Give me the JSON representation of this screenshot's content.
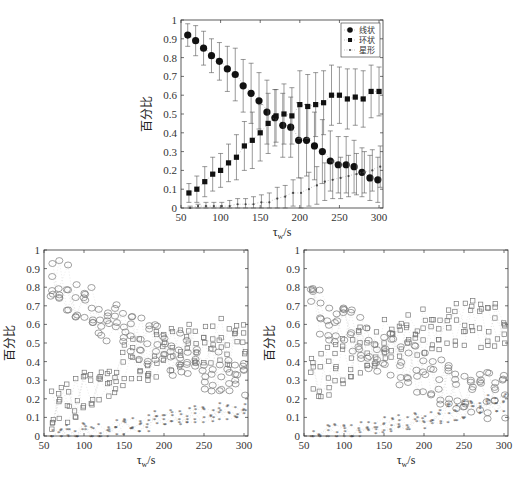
{
  "chart_data": [
    {
      "type": "scatter",
      "title": "",
      "xlabel": "τ_w/s",
      "ylabel": "百分比",
      "xlim": [
        50,
        305
      ],
      "ylim": [
        0,
        1
      ],
      "xticks": [
        50,
        100,
        150,
        200,
        250,
        300
      ],
      "yticks": [
        0,
        0.1,
        0.2,
        0.3,
        0.4,
        0.5,
        0.6,
        0.7,
        0.8,
        0.9,
        1
      ],
      "legend": {
        "position": "upper right",
        "entries": [
          "线状",
          "环状",
          "星形"
        ]
      },
      "error_bars": true,
      "x": [
        60,
        70,
        80,
        90,
        100,
        110,
        120,
        130,
        140,
        150,
        160,
        170,
        180,
        190,
        200,
        210,
        220,
        230,
        240,
        250,
        260,
        270,
        280,
        290,
        300
      ],
      "series": [
        {
          "name": "线状",
          "marker": "circle",
          "values": [
            0.92,
            0.89,
            0.85,
            0.81,
            0.78,
            0.74,
            0.71,
            0.65,
            0.61,
            0.57,
            0.51,
            0.48,
            0.44,
            0.43,
            0.36,
            0.36,
            0.33,
            0.3,
            0.25,
            0.23,
            0.23,
            0.22,
            0.19,
            0.16,
            0.15
          ],
          "err": [
            0.06,
            0.08,
            0.09,
            0.09,
            0.1,
            0.12,
            0.14,
            0.14,
            0.16,
            0.15,
            0.17,
            0.15,
            0.17,
            0.16,
            0.2,
            0.19,
            0.18,
            0.17,
            0.16,
            0.15,
            0.15,
            0.14,
            0.13,
            0.12,
            0.12
          ]
        },
        {
          "name": "环状",
          "marker": "square",
          "values": [
            0.08,
            0.1,
            0.14,
            0.18,
            0.2,
            0.24,
            0.27,
            0.33,
            0.36,
            0.4,
            0.45,
            0.49,
            0.5,
            0.49,
            0.55,
            0.54,
            0.55,
            0.56,
            0.6,
            0.6,
            0.58,
            0.59,
            0.58,
            0.62,
            0.62
          ],
          "err": [
            0.05,
            0.07,
            0.08,
            0.09,
            0.09,
            0.1,
            0.12,
            0.13,
            0.15,
            0.15,
            0.16,
            0.14,
            0.16,
            0.15,
            0.18,
            0.17,
            0.17,
            0.17,
            0.16,
            0.15,
            0.16,
            0.15,
            0.15,
            0.14,
            0.13
          ]
        },
        {
          "name": "星形",
          "marker": "dot",
          "values": [
            0.0,
            0.01,
            0.01,
            0.01,
            0.01,
            0.01,
            0.02,
            0.02,
            0.02,
            0.03,
            0.03,
            0.05,
            0.06,
            0.08,
            0.08,
            0.1,
            0.12,
            0.14,
            0.15,
            0.16,
            0.17,
            0.18,
            0.19,
            0.2,
            0.22
          ],
          "err": [
            0.01,
            0.01,
            0.02,
            0.02,
            0.02,
            0.03,
            0.03,
            0.03,
            0.04,
            0.04,
            0.05,
            0.06,
            0.06,
            0.07,
            0.08,
            0.09,
            0.1,
            0.1,
            0.1,
            0.11,
            0.11,
            0.11,
            0.11,
            0.11,
            0.11
          ]
        }
      ]
    },
    {
      "type": "scatter",
      "title": "",
      "xlabel": "τ_w/s",
      "ylabel": "百分比",
      "xlim": [
        50,
        305
      ],
      "ylim": [
        0,
        1
      ],
      "xticks": [
        50,
        100,
        150,
        200,
        250,
        300
      ],
      "yticks": [
        0,
        0.1,
        0.2,
        0.3,
        0.4,
        0.5,
        0.6,
        0.7,
        0.8,
        0.9,
        1
      ],
      "note": "Individual runs: circles=线状 (declining from ~0.9 to ~0.3), squares=环状 (rising from ~0.15 to ~0.5), stars=星形 (rising from ~0 to ~0.15)",
      "x": [
        60,
        70,
        80,
        90,
        100,
        110,
        120,
        130,
        140,
        150,
        160,
        170,
        180,
        190,
        200,
        210,
        220,
        230,
        240,
        250,
        260,
        270,
        280,
        290,
        300
      ],
      "series": [
        {
          "name": "线状",
          "marker": "circle-open",
          "values": [
            0.86,
            0.84,
            0.8,
            0.76,
            0.72,
            0.68,
            0.64,
            0.62,
            0.6,
            0.57,
            0.54,
            0.52,
            0.5,
            0.48,
            0.46,
            0.44,
            0.43,
            0.41,
            0.4,
            0.38,
            0.37,
            0.36,
            0.35,
            0.34,
            0.33
          ]
        },
        {
          "name": "环状",
          "marker": "square-open",
          "values": [
            0.14,
            0.16,
            0.19,
            0.23,
            0.26,
            0.29,
            0.32,
            0.34,
            0.36,
            0.38,
            0.4,
            0.41,
            0.43,
            0.44,
            0.45,
            0.46,
            0.47,
            0.48,
            0.49,
            0.5,
            0.5,
            0.51,
            0.51,
            0.52,
            0.52
          ]
        },
        {
          "name": "星形",
          "marker": "star",
          "values": [
            0.0,
            0.0,
            0.01,
            0.01,
            0.02,
            0.02,
            0.03,
            0.03,
            0.04,
            0.05,
            0.06,
            0.06,
            0.07,
            0.08,
            0.09,
            0.09,
            0.1,
            0.1,
            0.11,
            0.12,
            0.12,
            0.13,
            0.13,
            0.14,
            0.14
          ]
        }
      ]
    },
    {
      "type": "scatter",
      "title": "",
      "xlabel": "τ_w/s",
      "ylabel": "百分比",
      "xlim": [
        50,
        305
      ],
      "ylim": [
        0,
        1
      ],
      "xticks": [
        50,
        100,
        150,
        200,
        250,
        300
      ],
      "yticks": [
        0,
        0.1,
        0.2,
        0.3,
        0.4,
        0.5,
        0.6,
        0.7,
        0.8,
        0.9,
        1
      ],
      "note": "Individual runs: circles=线状 (declining from ~0.7 to ~0.2), squares=环状 (rising from ~0.3 to ~0.6), stars=星形 (rising from ~0 to ~0.2)",
      "x": [
        60,
        70,
        80,
        90,
        100,
        110,
        120,
        130,
        140,
        150,
        160,
        170,
        180,
        190,
        200,
        210,
        220,
        230,
        240,
        250,
        260,
        270,
        280,
        290,
        300
      ],
      "series": [
        {
          "name": "线状",
          "marker": "circle-open",
          "values": [
            0.68,
            0.66,
            0.63,
            0.61,
            0.58,
            0.55,
            0.52,
            0.49,
            0.47,
            0.45,
            0.43,
            0.4,
            0.38,
            0.36,
            0.34,
            0.32,
            0.3,
            0.28,
            0.27,
            0.25,
            0.24,
            0.23,
            0.22,
            0.21,
            0.2
          ]
        },
        {
          "name": "环状",
          "marker": "square-open",
          "values": [
            0.3,
            0.32,
            0.35,
            0.38,
            0.41,
            0.44,
            0.46,
            0.48,
            0.49,
            0.5,
            0.52,
            0.53,
            0.54,
            0.55,
            0.56,
            0.57,
            0.58,
            0.59,
            0.59,
            0.6,
            0.6,
            0.6,
            0.61,
            0.61,
            0.61
          ]
        },
        {
          "name": "星形",
          "marker": "star",
          "values": [
            0.0,
            0.01,
            0.01,
            0.01,
            0.02,
            0.02,
            0.03,
            0.03,
            0.04,
            0.05,
            0.06,
            0.07,
            0.07,
            0.08,
            0.09,
            0.1,
            0.11,
            0.12,
            0.13,
            0.14,
            0.15,
            0.16,
            0.17,
            0.17,
            0.18
          ]
        }
      ]
    }
  ],
  "labels": {
    "ylabel": "百分比",
    "xlabel_main": "τ",
    "xlabel_sub": "w",
    "xlabel_unit": "/s",
    "legend": [
      "线状",
      "环状",
      "星形"
    ]
  },
  "colors": {
    "axis": "#333333",
    "marker": "#111111",
    "errorbar": "#555555",
    "scatter_light": "#777777"
  }
}
